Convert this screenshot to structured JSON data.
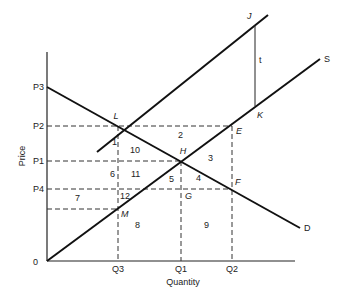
{
  "axes": {
    "x_label": "Quantity",
    "y_label": "Price",
    "origin": "0",
    "x_ticks": [
      "Q3",
      "Q1",
      "Q2"
    ],
    "y_ticks": [
      "P3",
      "P2",
      "P1",
      "P4"
    ]
  },
  "curves": {
    "demand": "D",
    "supply": "S",
    "tax_shift": "t"
  },
  "points": {
    "L": "L",
    "H": "H",
    "E": "E",
    "F": "F",
    "G": "G",
    "M": "M",
    "J": "J",
    "K": "K"
  },
  "areas": [
    "1",
    "2",
    "3",
    "4",
    "5",
    "6",
    "7",
    "8",
    "9",
    "10",
    "11",
    "12"
  ]
}
